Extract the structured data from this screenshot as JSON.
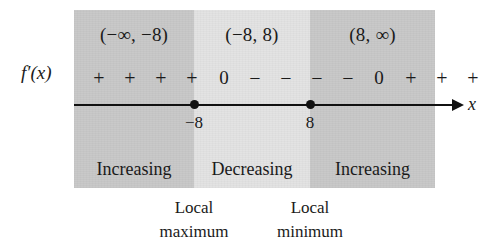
{
  "figure": {
    "kind": "sign-chart",
    "function_label": "f′(x)",
    "axis_variable": "x",
    "colors": {
      "region_dark": "#c9c9c9",
      "region_light": "#e3e3e3",
      "ink": "#111111",
      "background": "#ffffff"
    }
  },
  "regions": [
    {
      "interval": "(−∞, −8)",
      "signs": [
        "+",
        "+",
        "+",
        "+"
      ],
      "behavior": "Increasing",
      "shade": "dark"
    },
    {
      "interval": "(−8, 8)",
      "signs": [
        "−",
        "−",
        "−",
        "−"
      ],
      "behavior": "Decreasing",
      "shade": "light"
    },
    {
      "interval": "(8, ∞)",
      "signs": [
        "+",
        "+",
        "+",
        "+"
      ],
      "behavior": "Increasing",
      "shade": "dark"
    }
  ],
  "critical_points": [
    {
      "value": "−8",
      "sign_value": "0",
      "caption_line1": "Local",
      "caption_line2": "maximum"
    },
    {
      "value": "8",
      "sign_value": "0",
      "caption_line1": "Local",
      "caption_line2": "minimum"
    }
  ],
  "sign_sequence": [
    "+",
    "+",
    "+",
    "+",
    "0",
    "−",
    "−",
    "−",
    "−",
    "0",
    "+",
    "+",
    "+",
    "+"
  ]
}
